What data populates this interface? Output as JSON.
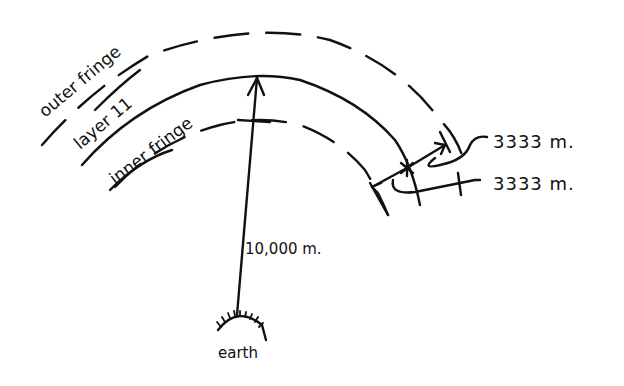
{
  "diagram": {
    "labels": {
      "outer_fringe": "outer fringe",
      "layer": "layer 11",
      "inner_fringe": "inner fringe",
      "radius": "10,000 m.",
      "outer_thickness": "3333 m.",
      "inner_thickness": "3333 m.",
      "earth": "earth"
    },
    "colors": {
      "ink": "#111111",
      "background": "#ffffff"
    }
  }
}
